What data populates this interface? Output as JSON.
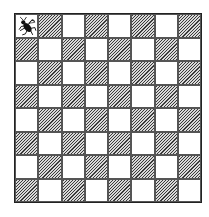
{
  "board": {
    "rows": 8,
    "cols": 8,
    "top_left_color": "light",
    "light_color": "#ffffff",
    "dark_style": "diagonal-hatch",
    "pieces": [
      {
        "row": 0,
        "col": 0,
        "type": "bug-icon"
      }
    ]
  }
}
